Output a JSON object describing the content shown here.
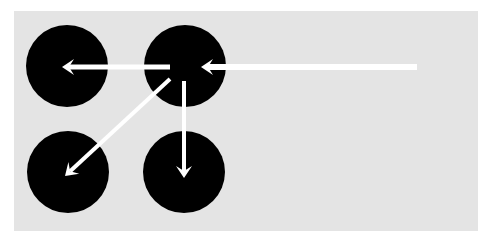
{
  "diagram": {
    "background": "#ffffff",
    "panel": {
      "x": 14,
      "y": 11,
      "width": 464,
      "height": 220,
      "color": "#e4e4e4"
    },
    "node_color": "#000000",
    "arrow_color": "#ffffff",
    "nodes": [
      {
        "id": "top-left",
        "cx": 67,
        "cy": 66,
        "r": 41
      },
      {
        "id": "top-right",
        "cx": 185,
        "cy": 66,
        "r": 41
      },
      {
        "id": "bottom-left",
        "cx": 68,
        "cy": 172,
        "r": 41
      },
      {
        "id": "bottom-right",
        "cx": 184,
        "cy": 172,
        "r": 41
      }
    ],
    "edges": [
      {
        "id": "incoming",
        "from": "external-right",
        "to": "top-right",
        "x1": 417,
        "y1": 67,
        "x2": 201,
        "y2": 67,
        "width": 6,
        "head": "chevron"
      },
      {
        "id": "to-top-left",
        "from": "top-right",
        "to": "top-left",
        "x1": 170,
        "y1": 67,
        "x2": 62,
        "y2": 67,
        "width": 5,
        "head": "chevron"
      },
      {
        "id": "to-bottom-left",
        "from": "top-right",
        "to": "bottom-left",
        "x1": 170,
        "y1": 79,
        "x2": 65,
        "y2": 176,
        "width": 4,
        "head": "chevron"
      },
      {
        "id": "to-bottom-right",
        "from": "top-right",
        "to": "bottom-right",
        "x1": 184,
        "y1": 81,
        "x2": 184,
        "y2": 178,
        "width": 4,
        "head": "chevron"
      }
    ]
  }
}
